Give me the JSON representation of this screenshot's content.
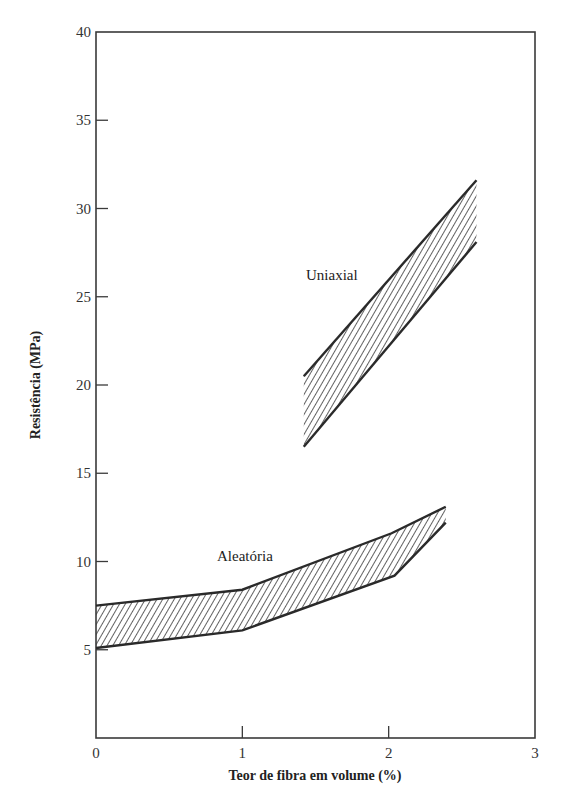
{
  "chart_data": {
    "type": "area",
    "title": "",
    "xlabel": "Teor de fibra em volume (%)",
    "ylabel": "Resistência (MPa)",
    "xlim": [
      0,
      3
    ],
    "ylim": [
      0,
      40
    ],
    "xticks": [
      0,
      1,
      2,
      3
    ],
    "yticks": [
      5,
      10,
      15,
      20,
      25,
      30,
      35,
      40
    ],
    "xtick_labels": [
      "0",
      "1",
      "2",
      "3"
    ],
    "ytick_labels": [
      "5",
      "10",
      "15",
      "20",
      "25",
      "30",
      "35",
      "40"
    ],
    "grid": false,
    "legend": "none (inline labels)",
    "series": [
      {
        "name": "Uniaxial",
        "fill": "hatched",
        "upper": {
          "x": [
            1.42,
            2.6
          ],
          "y": [
            20.5,
            31.6
          ]
        },
        "lower": {
          "x": [
            1.42,
            2.6
          ],
          "y": [
            16.5,
            28.1
          ]
        },
        "label_pos": {
          "x": 1.45,
          "y": 25.0
        }
      },
      {
        "name": "Aleatória",
        "fill": "hatched",
        "upper": {
          "x": [
            0.0,
            1.0,
            2.02,
            2.39
          ],
          "y": [
            7.5,
            8.4,
            11.6,
            13.1
          ]
        },
        "lower": {
          "x": [
            0.0,
            1.0,
            2.04,
            2.39
          ],
          "y": [
            5.1,
            6.1,
            9.2,
            12.2
          ]
        },
        "label_pos": {
          "x": 0.83,
          "y": 10.0
        }
      }
    ]
  },
  "labels": {
    "uniaxial": "Uniaxial",
    "aleatoria": "Aleatória",
    "xlabel": "Teor de fibra em volume (%)",
    "ylabel": "Resistência (MPa)"
  },
  "colors": {
    "line": "#2a2a2a",
    "hatch": "#3a3a3a",
    "axis": "#3a3a3a",
    "background": "#ffffff"
  }
}
